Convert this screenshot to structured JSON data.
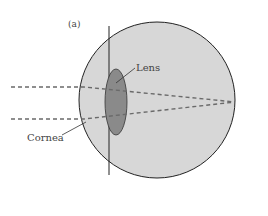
{
  "figure": {
    "panel_label": "(a)",
    "labels": {
      "lens": "Lens",
      "cornea": "Cornea"
    },
    "colors": {
      "eyeball_fill": "#d7d7d7",
      "cornea_fill": "#e2e2e2",
      "lens_fill": "#8a8a8a",
      "ray_color": "#6a6a6a",
      "outline": "#222222"
    }
  }
}
